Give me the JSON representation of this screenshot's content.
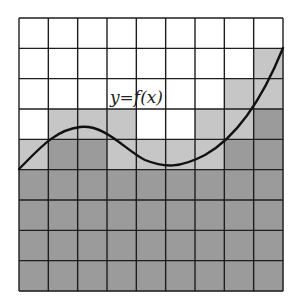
{
  "figure": {
    "label": "y=f(x)",
    "grid": {
      "columns": 9,
      "rows": 9,
      "left": 19,
      "top": 18,
      "right": 283,
      "bottom": 291
    },
    "colors": {
      "white": "#ffffff",
      "light": "#c6c6c6",
      "dark": "#9b9b9b",
      "line": "#1e1e1e",
      "curve": "#111111"
    },
    "shading_legend": {
      "W": "white (above curve)",
      "L": "light gray (partially under curve)",
      "D": "dark gray (fully under curve)"
    },
    "cells": [
      [
        "W",
        "W",
        "W",
        "W",
        "W",
        "W",
        "W",
        "W",
        "W"
      ],
      [
        "W",
        "W",
        "W",
        "W",
        "W",
        "W",
        "W",
        "W",
        "L"
      ],
      [
        "W",
        "W",
        "W",
        "W",
        "W",
        "W",
        "W",
        "L",
        "L"
      ],
      [
        "W",
        "L",
        "L",
        "L",
        "W",
        "W",
        "L",
        "L",
        "D"
      ],
      [
        "L",
        "D",
        "D",
        "L",
        "L",
        "L",
        "L",
        "D",
        "D"
      ],
      [
        "D",
        "D",
        "D",
        "D",
        "D",
        "D",
        "D",
        "D",
        "D"
      ],
      [
        "D",
        "D",
        "D",
        "D",
        "D",
        "D",
        "D",
        "D",
        "D"
      ],
      [
        "D",
        "D",
        "D",
        "D",
        "D",
        "D",
        "D",
        "D",
        "D"
      ],
      [
        "D",
        "D",
        "D",
        "D",
        "D",
        "D",
        "D",
        "D",
        "D"
      ]
    ],
    "curve_path": "M19,169 C40,148 55,130 80,127 C105,124 125,150 145,160 C165,168 180,168 205,155 C235,138 262,100 283,48"
  }
}
